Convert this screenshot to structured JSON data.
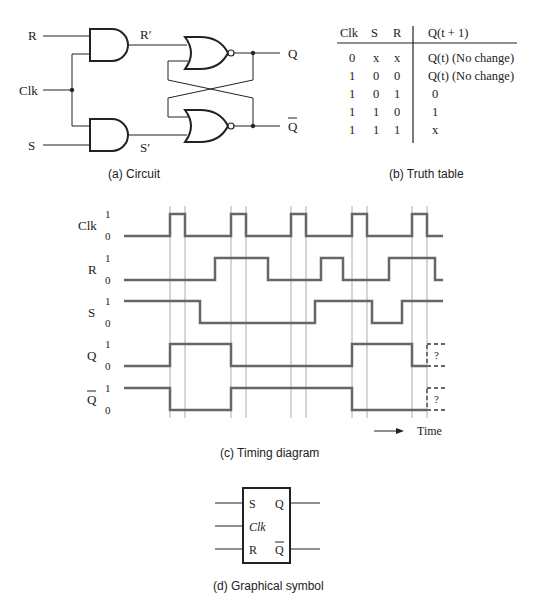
{
  "circuit": {
    "caption": "(a) Circuit",
    "inputs": {
      "r": "R",
      "clk": "Clk",
      "s": "S"
    },
    "internal": {
      "r_prime": "R′",
      "s_prime": "S′"
    },
    "outputs": {
      "q": "Q",
      "q_bar": "Q"
    }
  },
  "truth_table": {
    "caption": "(b) Truth table",
    "headers": [
      "Clk",
      "S",
      "R",
      "Q(t + 1)"
    ],
    "rows": [
      [
        "0",
        "x",
        "x",
        "Q(t) (No change)"
      ],
      [
        "1",
        "0",
        "0",
        "Q(t) (No change)"
      ],
      [
        "1",
        "0",
        "1",
        "0"
      ],
      [
        "1",
        "1",
        "0",
        "1"
      ],
      [
        "1",
        "1",
        "1",
        "x"
      ]
    ]
  },
  "timing": {
    "caption": "(c) Timing diagram",
    "time_label": "Time",
    "unknown_mark": "?",
    "signals": [
      {
        "name": "Clk",
        "high": "1",
        "low": "0"
      },
      {
        "name": "R",
        "high": "1",
        "low": "0"
      },
      {
        "name": "S",
        "high": "1",
        "low": "0"
      },
      {
        "name": "Q",
        "high": "1",
        "low": "0"
      },
      {
        "name": "Q",
        "high": "1",
        "low": "0"
      }
    ]
  },
  "symbol": {
    "caption": "(d) Graphical symbol",
    "pins": {
      "s": "S",
      "clk": "Clk",
      "r": "R",
      "q": "Q",
      "q_bar": "Q"
    }
  }
}
